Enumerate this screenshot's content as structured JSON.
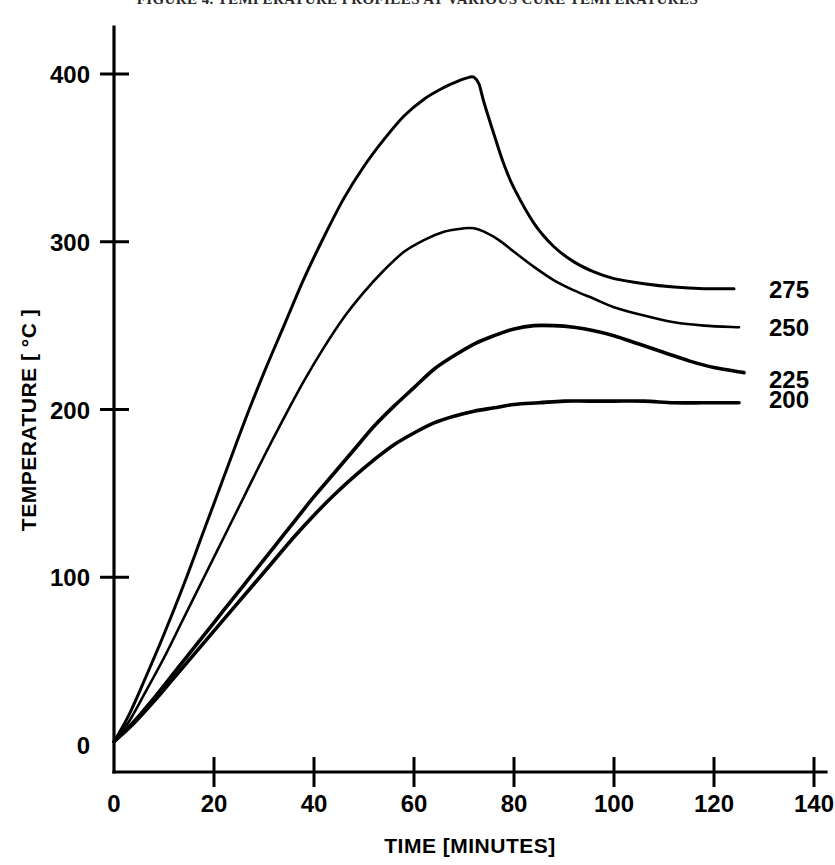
{
  "figure": {
    "title": "FIGURE 4. TEMPERATURE PROFILES AT VARIOUS CURE TEMPERATURES",
    "background_color": "#ffffff",
    "line_color": "#000000"
  },
  "chart_data": {
    "type": "line",
    "title": "",
    "xlabel": "TIME [MINUTES]",
    "ylabel": "TEMPERATURE [ °C ]",
    "xlim": [
      0,
      140
    ],
    "ylim": [
      0,
      430
    ],
    "xticks": [
      0,
      20,
      40,
      60,
      80,
      100,
      120,
      140
    ],
    "xtick_labels": [
      "0",
      "20",
      "40",
      "60",
      "80",
      "100",
      "120",
      "140"
    ],
    "yticks": [
      0,
      100,
      200,
      300,
      400
    ],
    "ytick_labels": [
      "0",
      "100",
      "200",
      "300",
      "400"
    ],
    "grid": false,
    "legend_position": "right-inline-labels",
    "series": [
      {
        "name": "275",
        "label": "275",
        "label_x": 131,
        "label_y": 272,
        "peak": {
          "x": 72,
          "y": 398
        },
        "end": {
          "x": 124,
          "y": 272
        },
        "points": [
          [
            0,
            2
          ],
          [
            3,
            18
          ],
          [
            6,
            38
          ],
          [
            10,
            66
          ],
          [
            14,
            96
          ],
          [
            18,
            128
          ],
          [
            22,
            160
          ],
          [
            26,
            192
          ],
          [
            30,
            222
          ],
          [
            34,
            250
          ],
          [
            38,
            278
          ],
          [
            42,
            303
          ],
          [
            46,
            326
          ],
          [
            50,
            345
          ],
          [
            54,
            361
          ],
          [
            58,
            375
          ],
          [
            62,
            385
          ],
          [
            66,
            392
          ],
          [
            69,
            396
          ],
          [
            71,
            398
          ],
          [
            72,
            398
          ],
          [
            73,
            394
          ],
          [
            74,
            383
          ],
          [
            76,
            364
          ],
          [
            78,
            346
          ],
          [
            80,
            332
          ],
          [
            84,
            311
          ],
          [
            88,
            297
          ],
          [
            92,
            288
          ],
          [
            96,
            282
          ],
          [
            100,
            278
          ],
          [
            106,
            275
          ],
          [
            112,
            273
          ],
          [
            118,
            272
          ],
          [
            124,
            272
          ]
        ]
      },
      {
        "name": "250",
        "label": "250",
        "label_x": 131,
        "label_y": 249,
        "peak": {
          "x": 72,
          "y": 308
        },
        "end": {
          "x": 125,
          "y": 249
        },
        "points": [
          [
            0,
            2
          ],
          [
            3,
            14
          ],
          [
            6,
            30
          ],
          [
            10,
            52
          ],
          [
            14,
            76
          ],
          [
            18,
            100
          ],
          [
            22,
            124
          ],
          [
            26,
            148
          ],
          [
            30,
            172
          ],
          [
            34,
            195
          ],
          [
            38,
            217
          ],
          [
            42,
            237
          ],
          [
            46,
            255
          ],
          [
            50,
            270
          ],
          [
            54,
            283
          ],
          [
            58,
            294
          ],
          [
            62,
            301
          ],
          [
            66,
            306
          ],
          [
            70,
            308
          ],
          [
            72,
            308
          ],
          [
            74,
            306
          ],
          [
            77,
            301
          ],
          [
            80,
            294
          ],
          [
            84,
            285
          ],
          [
            88,
            277
          ],
          [
            92,
            271
          ],
          [
            96,
            266
          ],
          [
            100,
            261
          ],
          [
            106,
            256
          ],
          [
            112,
            252
          ],
          [
            118,
            250
          ],
          [
            125,
            249
          ]
        ]
      },
      {
        "name": "225",
        "label": "225",
        "label_x": 131,
        "label_y": 218,
        "peak": {
          "x": 86,
          "y": 250
        },
        "end": {
          "x": 126,
          "y": 222
        },
        "points": [
          [
            0,
            2
          ],
          [
            4,
            14
          ],
          [
            8,
            28
          ],
          [
            12,
            43
          ],
          [
            16,
            58
          ],
          [
            20,
            73
          ],
          [
            24,
            88
          ],
          [
            28,
            103
          ],
          [
            32,
            118
          ],
          [
            36,
            133
          ],
          [
            40,
            148
          ],
          [
            44,
            162
          ],
          [
            48,
            176
          ],
          [
            52,
            190
          ],
          [
            56,
            202
          ],
          [
            60,
            213
          ],
          [
            64,
            224
          ],
          [
            68,
            232
          ],
          [
            72,
            239
          ],
          [
            76,
            244
          ],
          [
            80,
            248
          ],
          [
            84,
            250
          ],
          [
            88,
            250
          ],
          [
            92,
            249
          ],
          [
            96,
            247
          ],
          [
            100,
            244
          ],
          [
            105,
            239
          ],
          [
            110,
            234
          ],
          [
            115,
            229
          ],
          [
            120,
            225
          ],
          [
            126,
            222
          ]
        ]
      },
      {
        "name": "200",
        "label": "200",
        "label_x": 131,
        "label_y": 206,
        "peak": {
          "x": 95,
          "y": 205
        },
        "end": {
          "x": 125,
          "y": 204
        },
        "points": [
          [
            0,
            2
          ],
          [
            4,
            13
          ],
          [
            8,
            26
          ],
          [
            12,
            40
          ],
          [
            16,
            54
          ],
          [
            20,
            68
          ],
          [
            24,
            82
          ],
          [
            28,
            96
          ],
          [
            32,
            110
          ],
          [
            36,
            124
          ],
          [
            40,
            137
          ],
          [
            44,
            149
          ],
          [
            48,
            160
          ],
          [
            52,
            170
          ],
          [
            56,
            179
          ],
          [
            60,
            186
          ],
          [
            64,
            192
          ],
          [
            68,
            196
          ],
          [
            72,
            199
          ],
          [
            76,
            201
          ],
          [
            80,
            203
          ],
          [
            85,
            204
          ],
          [
            90,
            205
          ],
          [
            95,
            205
          ],
          [
            100,
            205
          ],
          [
            106,
            205
          ],
          [
            112,
            204
          ],
          [
            118,
            204
          ],
          [
            125,
            204
          ]
        ]
      }
    ]
  }
}
